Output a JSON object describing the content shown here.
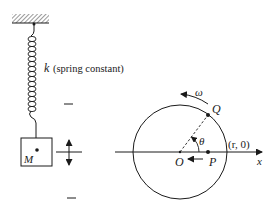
{
  "diagram": {
    "left_panel": {
      "title": "Spring-mass system",
      "spring_label_symbol": "k",
      "spring_label_text": "(spring constant)",
      "mass_label": "M",
      "equilibrium_marks": [
        "upper-limit-mark",
        "equilibrium-line",
        "lower-limit-mark"
      ],
      "motion_indicator": "vertical double arrow"
    },
    "right_panel": {
      "title": "Uniform circular motion reference circle",
      "center_label": "O",
      "point_on_circle_label": "Q",
      "projection_point_label": "P",
      "angle_label": "θ",
      "angular_velocity_label": "ω",
      "intercept_label": "(r, 0)",
      "axis_label": "x"
    },
    "colors": {
      "stroke": "#1a1a1a",
      "background": "#ffffff",
      "hatch": "#555555"
    }
  }
}
